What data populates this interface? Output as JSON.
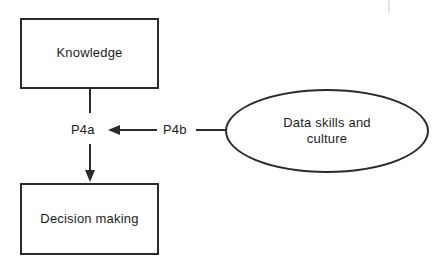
{
  "diagram": {
    "background_color": "#ffffff",
    "stroke_color": "#2b2b2b",
    "text_color": "#1d1d1d",
    "nodes": [
      {
        "id": "knowledge",
        "shape": "rectangle",
        "label": "Knowledge"
      },
      {
        "id": "decision-making",
        "shape": "rectangle",
        "label": "Decision making"
      },
      {
        "id": "data-skills-culture",
        "shape": "ellipse",
        "label": "Data skills and\nculture"
      }
    ],
    "edges": [
      {
        "id": "p4a",
        "label": "P4a",
        "from": "knowledge",
        "to": "decision-making",
        "direction": "down",
        "arrow": true
      },
      {
        "id": "p4b",
        "label": "P4b",
        "from": "data-skills-culture",
        "to": "p4a",
        "direction": "left",
        "arrow": true
      }
    ]
  }
}
